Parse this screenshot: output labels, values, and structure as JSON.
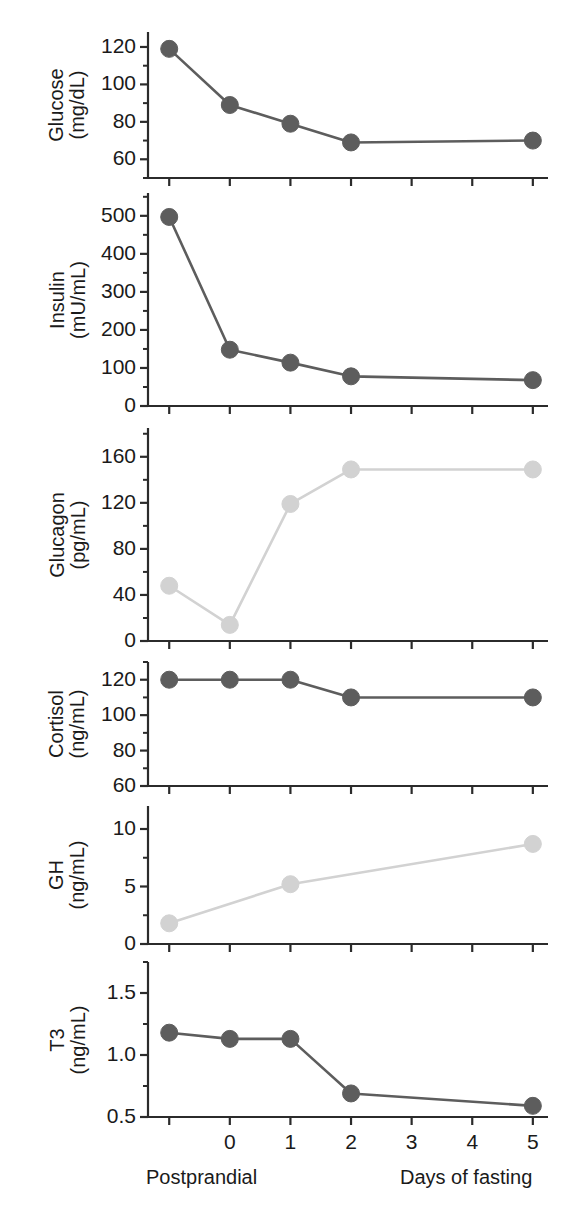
{
  "figure": {
    "xaxis": {
      "tick_labels": [
        "",
        "0",
        "1",
        "2",
        "3",
        "4",
        "5"
      ],
      "tick_values": [
        -1,
        0,
        1,
        2,
        3,
        4,
        5
      ],
      "caption_left": "Postprandial",
      "caption_right": "Days of fasting"
    },
    "colors": {
      "dark_series": "#5d5d5d",
      "light_series": "#d2d2d2",
      "axis": "#2b2b2b",
      "text": "#1a1a1a"
    }
  },
  "chart_data": [
    {
      "type": "line",
      "title": "Glucose",
      "ylabel_line1": "Glucose",
      "ylabel_line2": "(mg/dL)",
      "units": "mg/dL",
      "series_color": "#5d5d5d",
      "x": [
        -1,
        0,
        1,
        2,
        5
      ],
      "xlabel": "Days of fasting",
      "values": [
        119,
        89,
        79,
        69,
        70
      ],
      "ylim": [
        50,
        128
      ],
      "yticks": [
        60,
        80,
        100,
        120
      ],
      "ytick_labels": [
        "60",
        "80",
        "100",
        "120"
      ],
      "minor_ticks": true,
      "grid": false
    },
    {
      "type": "line",
      "title": "Insulin",
      "ylabel_line1": "Insulin",
      "ylabel_line2": "(mU/mL)",
      "units": "mU/mL",
      "series_color": "#5d5d5d",
      "x": [
        -1,
        0,
        1,
        2,
        5
      ],
      "xlabel": "Days of fasting",
      "values": [
        497,
        148,
        114,
        78,
        68
      ],
      "ylim": [
        0,
        560
      ],
      "yticks": [
        0,
        100,
        200,
        300,
        400,
        500
      ],
      "ytick_labels": [
        "0",
        "100",
        "200",
        "300",
        "400",
        "500"
      ],
      "minor_ticks": true,
      "grid": false
    },
    {
      "type": "line",
      "title": "Glucagon",
      "ylabel_line1": "Glucagon",
      "ylabel_line2": "(pg/mL)",
      "units": "pg/mL",
      "series_color": "#d2d2d2",
      "x": [
        -1,
        0,
        1,
        2,
        5
      ],
      "xlabel": "Days of fasting",
      "values": [
        48,
        14,
        119,
        149,
        149
      ],
      "ylim": [
        0,
        185
      ],
      "yticks": [
        0,
        40,
        80,
        120,
        160
      ],
      "ytick_labels": [
        "0",
        "40",
        "80",
        "120",
        "160"
      ],
      "minor_ticks": true,
      "grid": false
    },
    {
      "type": "line",
      "title": "Cortisol",
      "ylabel_line1": "Cortisol",
      "ylabel_line2": "(ng/mL)",
      "units": "ng/mL",
      "series_color": "#5d5d5d",
      "x": [
        -1,
        0,
        1,
        2,
        5
      ],
      "xlabel": "Days of fasting",
      "values": [
        120,
        120,
        120,
        110,
        110
      ],
      "ylim": [
        60,
        130
      ],
      "yticks": [
        60,
        80,
        100,
        120
      ],
      "ytick_labels": [
        "60",
        "80",
        "100",
        "120"
      ],
      "minor_ticks": true,
      "grid": false
    },
    {
      "type": "line",
      "title": "GH",
      "ylabel_line1": "GH",
      "ylabel_line2": "(ng/mL)",
      "units": "ng/mL",
      "series_color": "#d2d2d2",
      "x": [
        -1,
        1,
        5
      ],
      "xlabel": "Days of fasting",
      "values": [
        1.8,
        5.2,
        8.7
      ],
      "ylim": [
        0,
        12
      ],
      "yticks": [
        0,
        5,
        10
      ],
      "ytick_labels": [
        "0",
        "5",
        "10"
      ],
      "minor_ticks": true,
      "grid": false
    },
    {
      "type": "line",
      "title": "T3",
      "ylabel_line1": "T3",
      "ylabel_line2": "(ng/mL)",
      "units": "ng/mL",
      "series_color": "#5d5d5d",
      "x": [
        -1,
        0,
        1,
        2,
        5
      ],
      "xlabel": "Days of fasting",
      "values": [
        1.18,
        1.13,
        1.13,
        0.69,
        0.59
      ],
      "ylim": [
        0.5,
        1.75
      ],
      "yticks": [
        0.5,
        1.0,
        1.5
      ],
      "ytick_labels": [
        "0.5",
        "1.0",
        "1.5"
      ],
      "minor_ticks": true,
      "grid": false
    }
  ]
}
